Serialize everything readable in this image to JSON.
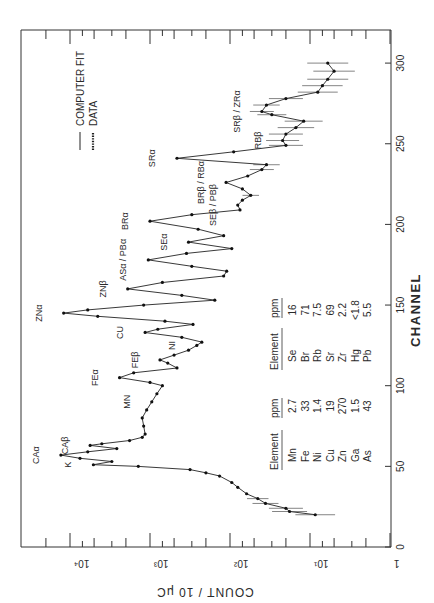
{
  "chart_data": {
    "type": "line",
    "orientation": "rotated-90-ccw",
    "title": "",
    "xlabel": "CHANNEL",
    "ylabel": "COUNT / 10 μC",
    "xlim": [
      0,
      320
    ],
    "ylim": [
      1,
      20000
    ],
    "yscale": "log",
    "x_ticks": [
      0,
      50,
      100,
      150,
      200,
      250,
      300
    ],
    "x_tick_labels": [
      "0",
      "50",
      "100",
      "150",
      "200",
      "250",
      "300"
    ],
    "y_ticks": [
      1,
      10,
      100,
      1000,
      10000
    ],
    "y_tick_labels": [
      "1",
      "10¹",
      "10²",
      "10³",
      "10⁴"
    ],
    "grid": false,
    "legend": {
      "position": "upper-left (rotated)",
      "entries": [
        {
          "symbol": "line",
          "label": "COMPUTER FIT"
        },
        {
          "symbol": "dots",
          "label": "DATA"
        }
      ]
    },
    "series": [
      {
        "name": "COMPUTER FIT / DATA",
        "x": [
          20,
          22,
          24,
          27,
          30,
          33,
          37,
          40,
          44,
          46,
          48,
          50,
          51,
          53,
          55,
          57,
          59,
          61,
          63,
          64,
          66,
          68,
          70,
          75,
          80,
          85,
          90,
          95,
          100,
          102,
          105,
          108,
          111,
          114,
          116,
          119,
          122,
          125,
          127,
          130,
          133,
          135,
          138,
          140,
          143,
          145,
          147,
          150,
          153,
          156,
          160,
          164,
          168,
          171,
          174,
          178,
          182,
          185,
          189,
          193,
          197,
          202,
          206,
          209,
          212,
          215,
          218,
          222,
          226,
          230,
          234,
          237,
          241,
          245,
          249,
          252,
          256,
          260,
          264,
          268,
          270,
          274,
          278,
          282,
          286,
          290,
          295,
          300
        ],
        "values": [
          8.6,
          18,
          20,
          36,
          45,
          62,
          80,
          95,
          135,
          200,
          316,
          1400,
          5100,
          3000,
          7500,
          13000,
          6000,
          2600,
          5600,
          4000,
          1800,
          1250,
          1150,
          1200,
          1250,
          1100,
          950,
          820,
          700,
          1000,
          2400,
          1600,
          460,
          600,
          750,
          500,
          330,
          260,
          225,
          400,
          1150,
          800,
          290,
          650,
          4500,
          12000,
          6000,
          1200,
          155,
          400,
          1900,
          700,
          120,
          110,
          300,
          1050,
          350,
          95,
          330,
          120,
          250,
          1000,
          300,
          75,
          80,
          70,
          55,
          70,
          112,
          60,
          40,
          35,
          460,
          90,
          20,
          22,
          20,
          15,
          12,
          30,
          40,
          35,
          20,
          8,
          7,
          6,
          5,
          6
        ]
      }
    ],
    "annotations": [
      {
        "label": "K",
        "channel": 51
      },
      {
        "label": "CAα",
        "channel": 57
      },
      {
        "label": "CAβ",
        "channel": 63
      },
      {
        "label": "MN",
        "channel": 90
      },
      {
        "label": "FEα",
        "channel": 105
      },
      {
        "label": "FEβ",
        "channel": 116
      },
      {
        "label": "NI",
        "channel": 125
      },
      {
        "label": "CU",
        "channel": 133
      },
      {
        "label": "ZNα",
        "channel": 145
      },
      {
        "label": "ZNβ",
        "channel": 160
      },
      {
        "label": "ASα / PBα",
        "channel": 178
      },
      {
        "label": "SEα",
        "channel": 189
      },
      {
        "label": "BRα",
        "channel": 202
      },
      {
        "label": "SEβ / PBβ",
        "channel": 212
      },
      {
        "label": "BRβ / RBα",
        "channel": 226
      },
      {
        "label": "SRα",
        "channel": 241
      },
      {
        "label": "RBβ",
        "channel": 252
      },
      {
        "label": "SRβ / ZRα",
        "channel": 270
      }
    ],
    "inset_table": {
      "columns": [
        "Element",
        "ppm",
        "Element",
        "ppm"
      ],
      "rows": [
        [
          "Mn",
          "2.7",
          "Se",
          "16"
        ],
        [
          "Fe",
          "33",
          "Br",
          "71"
        ],
        [
          "Ni",
          "1.4",
          "Rb",
          "7.5"
        ],
        [
          "Cu",
          "19",
          "Sr",
          "69"
        ],
        [
          "Zn",
          "270",
          "Zr",
          "2.2"
        ],
        [
          "Ga",
          "1.5",
          "Hg",
          "<1.8"
        ],
        [
          "As",
          "43",
          "Pb",
          "5.5"
        ]
      ]
    }
  },
  "labels": {
    "xlabel": "CHANNEL",
    "ylabel": "COUNT / 10 μC",
    "legend_fit": "COMPUTER FIT",
    "legend_data": "DATA",
    "table_h1": "Element",
    "table_h2": "ppm",
    "table_h3": "Element",
    "table_h4": "ppm"
  }
}
